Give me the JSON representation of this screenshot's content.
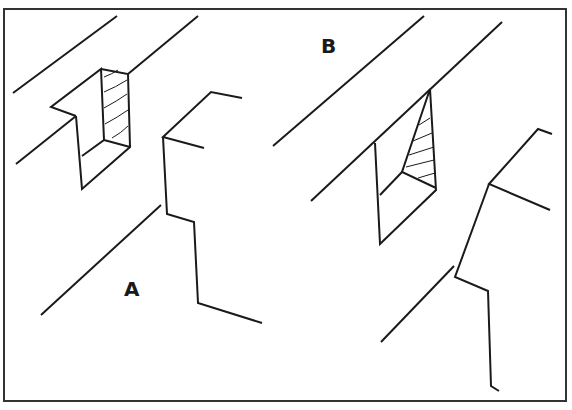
{
  "figure": {
    "labels": {
      "a": "A",
      "b": "B"
    },
    "colors": {
      "line": "#1a1a1a",
      "background": "#ffffff",
      "border": "#333333"
    }
  }
}
